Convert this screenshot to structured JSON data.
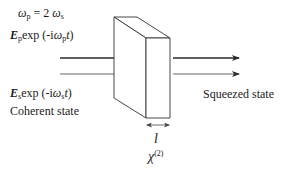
{
  "diagram": {
    "freq_relation": {
      "lhs": "ω",
      "lhs_sub": "p",
      "eq": " = 2 ",
      "rhs": "ω",
      "rhs_sub": "s"
    },
    "pump_field": {
      "E": "E",
      "E_sub": "p",
      "exp_pre": "exp (-i",
      "omega": "ω",
      "omega_sub": "p",
      "t": "t",
      "close": ")"
    },
    "signal_field": {
      "E": "E",
      "E_sub": "s",
      "exp_pre": "exp (-i",
      "omega": "ω",
      "omega_sub": "s",
      "t": "t",
      "close": ")"
    },
    "input_label": "Coherent state",
    "output_label": "Squeezed state",
    "crystal_length_label": "l",
    "nonlinearity": {
      "symbol": "χ",
      "sup": "(2)"
    },
    "colors": {
      "line": "#2a2a2a",
      "background": "#ffffff"
    }
  }
}
